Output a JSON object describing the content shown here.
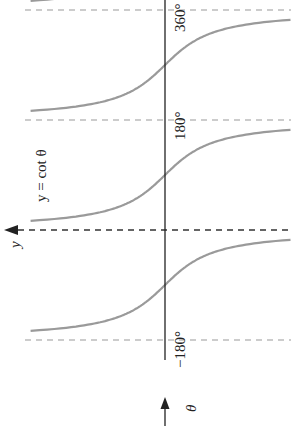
{
  "chart_data": {
    "type": "line",
    "title": "",
    "function_label": "y = cot θ",
    "xlabel": "θ",
    "ylabel": "y",
    "orientation": "rotated 90° counter-clockwise (θ axis points up, y axis points left)",
    "x_ticks": [
      {
        "value": -180,
        "label": "−180°"
      },
      {
        "value": 180,
        "label": "180°"
      },
      {
        "value": 360,
        "label": "360°"
      }
    ],
    "asymptotes": [
      -180,
      0,
      180,
      360
    ],
    "xlim": [
      -270,
      370
    ],
    "ylim": [
      -3.5,
      3.5
    ],
    "series": [
      {
        "name": "y = cot θ",
        "function": "cot",
        "color": "#9a9a9a",
        "branches": [
          [
            -180,
            0
          ],
          [
            0,
            180
          ],
          [
            180,
            360
          ],
          [
            360,
            540
          ]
        ]
      }
    ],
    "grid": false,
    "colors": {
      "curve": "#9a9a9a",
      "axis": "#222222",
      "asymptote": "#999999"
    }
  }
}
